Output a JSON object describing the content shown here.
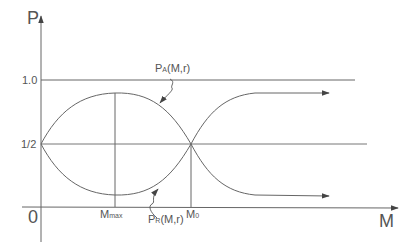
{
  "diagram": {
    "y_axis_label": "P",
    "x_axis_label": "M",
    "origin_label": "0",
    "y_ticks": [
      {
        "label": "1.0",
        "value": 1.0
      },
      {
        "label": "1/2",
        "value": 0.5
      }
    ],
    "x_markers": [
      {
        "main": "M",
        "sub": "max"
      },
      {
        "main": "M",
        "sub": "0"
      }
    ],
    "curves": [
      {
        "name": "P_A(M,r)",
        "main": "P",
        "sub": "A",
        "args": "(M,r)",
        "description": "rises from 1/2 to a maximum near M_max, falls through 1/2 at M_0, then tends to 1"
      },
      {
        "name": "P_R(M,r)",
        "main": "P",
        "sub": "R",
        "args": "(M,r)",
        "description": "falls from 1/2 to a minimum near M_max, rises through 1/2 at M_0, then tends to 0"
      }
    ],
    "colors": {
      "line": "#555555",
      "background": "#ffffff"
    }
  }
}
